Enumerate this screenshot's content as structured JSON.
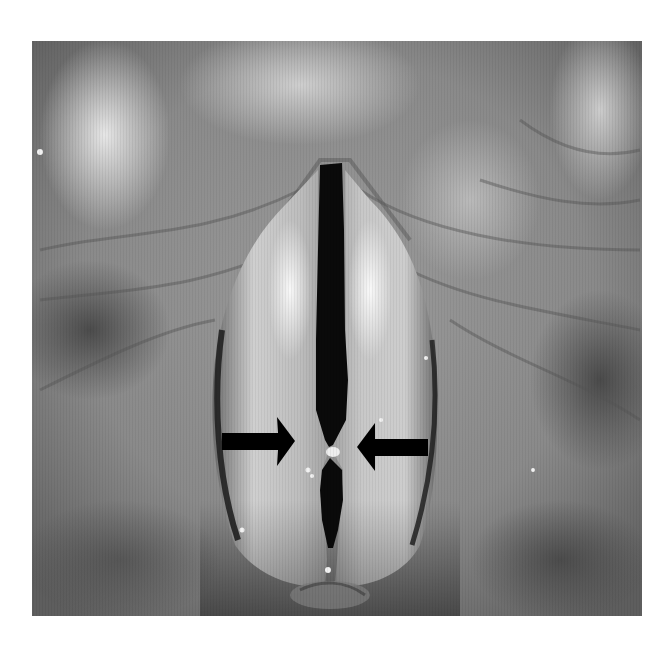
{
  "figure": {
    "type": "grayscale laryngoscopic photograph",
    "alt_text": "Laryngoscopic view of the vocal folds with two black arrows pointing at a point of contact between the folds at mid-length",
    "image_bounds": {
      "x": 32,
      "y": 41,
      "width": 610,
      "height": 575
    },
    "background_color": "#ffffff"
  },
  "annotations": {
    "arrows": [
      {
        "name": "left-arrow",
        "direction": "right",
        "color": "#000000",
        "tip": {
          "x": 295,
          "y": 441
        }
      },
      {
        "name": "right-arrow",
        "direction": "left",
        "color": "#000000",
        "tip": {
          "x": 357,
          "y": 447
        }
      }
    ],
    "contact_point": {
      "x": 329,
      "y": 447
    }
  },
  "colors": {
    "tissue_dark": "#4a4a4a",
    "tissue_mid": "#8c8c8c",
    "tissue_light": "#d8d8d8",
    "highlight": "#f4f4f4",
    "glottis": "#0a0a0a",
    "arrow": "#000000"
  }
}
